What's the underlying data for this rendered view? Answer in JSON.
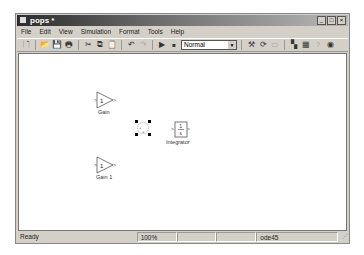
{
  "window": {
    "title": "pops *",
    "controls": [
      "minimize",
      "maximize",
      "close"
    ]
  },
  "menubar": [
    "File",
    "Edit",
    "View",
    "Simulation",
    "Format",
    "Tools",
    "Help"
  ],
  "toolbar": {
    "buttons": [
      "new-model",
      "open",
      "save",
      "print",
      "cut",
      "copy",
      "paste",
      "undo",
      "redo",
      "start-simulation",
      "stop-simulation"
    ],
    "sim_mode": "Normal",
    "buttons_right": [
      "build",
      "refresh",
      "update-diagram",
      "library-browser",
      "model-explorer",
      "debug",
      "help"
    ]
  },
  "canvas": {
    "blocks": [
      {
        "type": "gain",
        "value": "1",
        "label": "Gain"
      },
      {
        "type": "sum",
        "value": "+ +",
        "label": "",
        "selected": true
      },
      {
        "type": "integrator",
        "value_num": "1",
        "value_den": "s",
        "label": "Integrator"
      },
      {
        "type": "gain",
        "value": "1",
        "label": "Gain 1"
      }
    ]
  },
  "statusbar": {
    "status": "Ready",
    "zoom": "100%",
    "blank1": "",
    "blank2": "",
    "solver": "ode45"
  }
}
